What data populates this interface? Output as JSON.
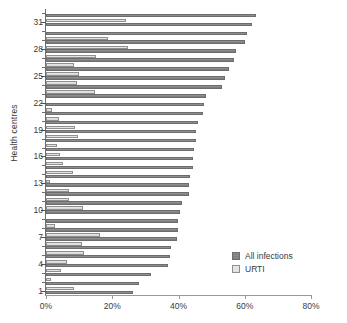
{
  "chart_data": {
    "type": "bar",
    "orientation": "horizontal",
    "title": "",
    "xlabel": "",
    "ylabel": "Health centres",
    "xlim": [
      0,
      80
    ],
    "ylim": [
      0,
      33
    ],
    "grid": false,
    "legend_position": "bottom-right",
    "xticks": [
      0,
      20,
      40,
      60,
      80
    ],
    "xtick_labels": [
      "0%",
      "20%",
      "40%",
      "60%",
      "80%"
    ],
    "yticks": [
      1,
      4,
      7,
      10,
      13,
      16,
      19,
      22,
      25,
      28,
      31
    ],
    "ytick_labels": [
      "1",
      "4",
      "7",
      "10",
      "13",
      "16",
      "19",
      "22",
      "25",
      "28",
      "31"
    ],
    "categories": [
      1,
      2,
      3,
      4,
      5,
      6,
      7,
      8,
      9,
      10,
      11,
      12,
      13,
      14,
      15,
      16,
      17,
      18,
      19,
      20,
      21,
      22,
      23,
      24,
      25,
      26,
      27,
      28,
      29,
      30,
      31,
      32
    ],
    "series": [
      {
        "name": "All infections",
        "color": "#808080",
        "values": [
          26.2,
          28.2,
          31.8,
          36.9,
          37.5,
          37.7,
          39.4,
          39.8,
          39.9,
          40.4,
          41.2,
          43.2,
          43.3,
          43.6,
          44.3,
          44.4,
          44.8,
          45.2,
          45.4,
          45.8,
          47.5,
          47.8,
          48.2,
          53.0,
          54.0,
          55.2,
          56.9,
          57.5,
          60.1,
          60.8,
          62.1,
          63.3
        ]
      },
      {
        "name": "URTI",
        "color": "#e0e0e0",
        "values": [
          8.4,
          1.5,
          4.4,
          6.4,
          11.5,
          10.8,
          16.3,
          2.6,
          0.0,
          11.2,
          6.9,
          6.8,
          1.1,
          8.3,
          5.0,
          4.3,
          3.4,
          9.6,
          8.9,
          3.9,
          1.9,
          0.0,
          14.9,
          9.4,
          9.9,
          8.5,
          15.1,
          24.8,
          18.6,
          0.0,
          24.3,
          0.0
        ]
      }
    ]
  },
  "legend": {
    "items": [
      {
        "label": "All infections",
        "swatch": "all"
      },
      {
        "label": "URTI",
        "swatch": "urti"
      }
    ]
  }
}
